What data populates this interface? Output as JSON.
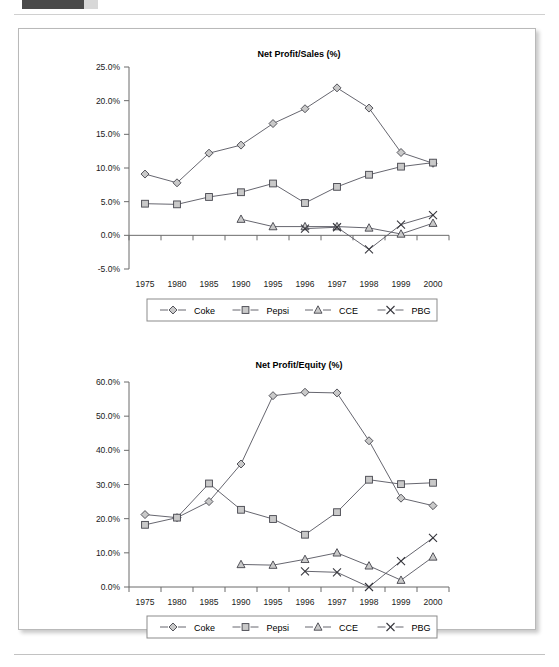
{
  "page": {
    "tab_color": "#4a4a4a",
    "paper_background": "#ffffff"
  },
  "chart_data": [
    {
      "id": "net-profit-sales",
      "type": "line",
      "title": "Net Profit/Sales (%)",
      "xlabel": "",
      "ylabel": "",
      "categories": [
        "1975",
        "1980",
        "1985",
        "1990",
        "1995",
        "1996",
        "1997",
        "1998",
        "1999",
        "2000"
      ],
      "ylim": [
        -5.0,
        25.0
      ],
      "ytick_step": 5.0,
      "ytick_labels": [
        "25.0%",
        "20.0%",
        "15.0%",
        "10.0%",
        "5.0%",
        "0.0%",
        "-5.0%"
      ],
      "ytick_values": [
        25.0,
        20.0,
        15.0,
        10.0,
        5.0,
        0.0,
        -5.0
      ],
      "grid": false,
      "legend_position": "bottom",
      "series": [
        {
          "name": "Coke",
          "marker": "diamond",
          "values": [
            9.1,
            7.8,
            12.2,
            13.4,
            16.6,
            18.8,
            21.9,
            18.9,
            12.3,
            10.7
          ]
        },
        {
          "name": "Pepsi",
          "marker": "square",
          "values": [
            4.7,
            4.6,
            5.7,
            6.4,
            7.7,
            4.8,
            7.2,
            9.0,
            10.2,
            10.8
          ]
        },
        {
          "name": "CCE",
          "marker": "triangle",
          "values": [
            null,
            null,
            null,
            2.4,
            1.3,
            1.3,
            1.3,
            1.1,
            0.2,
            1.8
          ]
        },
        {
          "name": "PBG",
          "marker": "cross",
          "values": [
            null,
            null,
            null,
            null,
            null,
            1.0,
            1.2,
            -2.1,
            1.6,
            3.0
          ]
        }
      ]
    },
    {
      "id": "net-profit-equity",
      "type": "line",
      "title": "Net Profit/Equity (%)",
      "xlabel": "",
      "ylabel": "",
      "categories": [
        "1975",
        "1980",
        "1985",
        "1990",
        "1995",
        "1996",
        "1997",
        "1998",
        "1999",
        "2000"
      ],
      "ylim": [
        0.0,
        60.0
      ],
      "ytick_step": 10.0,
      "ytick_labels": [
        "60.0%",
        "50.0%",
        "40.0%",
        "30.0%",
        "20.0%",
        "10.0%",
        "0.0%"
      ],
      "ytick_values": [
        60.0,
        50.0,
        40.0,
        30.0,
        20.0,
        10.0,
        0.0
      ],
      "grid": false,
      "legend_position": "bottom",
      "series": [
        {
          "name": "Coke",
          "marker": "diamond",
          "values": [
            21.2,
            20.3,
            25.0,
            36.0,
            56.0,
            57.0,
            56.8,
            42.8,
            26.0,
            23.8
          ]
        },
        {
          "name": "Pepsi",
          "marker": "square",
          "values": [
            18.2,
            20.3,
            30.3,
            22.6,
            19.9,
            15.3,
            21.9,
            31.4,
            30.1,
            30.5
          ]
        },
        {
          "name": "CCE",
          "marker": "triangle",
          "values": [
            null,
            null,
            null,
            6.6,
            6.4,
            8.1,
            10.0,
            6.2,
            2.0,
            8.8
          ]
        },
        {
          "name": "PBG",
          "marker": "cross",
          "values": [
            null,
            null,
            null,
            null,
            null,
            4.6,
            4.3,
            0.0,
            7.6,
            14.4
          ]
        }
      ]
    }
  ],
  "legend": {
    "entries": [
      {
        "label": "Coke",
        "marker": "diamond"
      },
      {
        "label": "Pepsi",
        "marker": "square"
      },
      {
        "label": "CCE",
        "marker": "triangle"
      },
      {
        "label": "PBG",
        "marker": "cross"
      }
    ]
  }
}
